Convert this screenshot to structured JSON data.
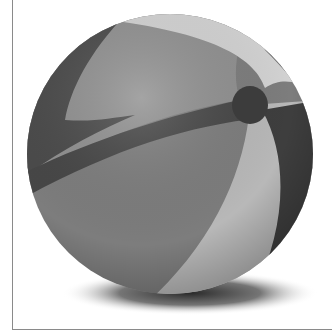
{
  "image": {
    "subject": "beach ball",
    "style": "grayscale",
    "width": 332,
    "height": 334
  },
  "colors": {
    "background": "#ffffff",
    "border": "#8a8a8a",
    "panel_dark": "#4a4a4a",
    "panel_mid": "#7a7a7a",
    "panel_light": "#b4b4b4",
    "panel_lighter": "#cfcfcf",
    "valve": "#3c3c3c",
    "shadow": "#2a2a2a"
  }
}
